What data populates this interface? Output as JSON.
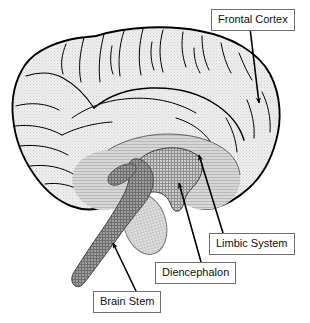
{
  "figure": {
    "width": 310,
    "height": 323,
    "background_color": "#ffffff"
  },
  "labels": [
    {
      "id": "frontal-cortex",
      "text": "Frontal Cortex",
      "box": {
        "x": 211,
        "y": 9,
        "w": 91,
        "h": 19
      },
      "leader": {
        "x1": 250,
        "y1": 28,
        "x2": 259,
        "y2": 106
      },
      "points_to": "frontal lobe cortex, right side of the brain"
    },
    {
      "id": "limbic-system",
      "text": "Limbic System",
      "box": {
        "x": 209,
        "y": 233,
        "w": 90,
        "h": 19
      },
      "leader": {
        "x1": 223,
        "y1": 233,
        "x2": 198,
        "y2": 152
      },
      "points_to": "limbic system, medium-gray band around the diencephalon"
    },
    {
      "id": "diencephalon",
      "text": "Diencephalon",
      "box": {
        "x": 155,
        "y": 262,
        "w": 85,
        "h": 19
      },
      "leader": {
        "x1": 201,
        "y1": 262,
        "x2": 178,
        "y2": 180
      },
      "points_to": "diencephalon, cross-hatched central mass"
    },
    {
      "id": "brain-stem",
      "text": "Brain Stem",
      "box": {
        "x": 93,
        "y": 291,
        "w": 73,
        "h": 19
      },
      "leader": {
        "x1": 136,
        "y1": 291,
        "x2": 112,
        "y2": 240
      },
      "points_to": "brain stem, dark-gray descending column"
    }
  ],
  "regions": [
    {
      "id": "cortex",
      "name": "Cerebral cortex",
      "fill": "#e8e8e8",
      "texture": "fine-stipple"
    },
    {
      "id": "limbic",
      "name": "Limbic system",
      "fill": "#c4c4c4",
      "texture": "fine-stipple"
    },
    {
      "id": "diencephalon",
      "name": "Diencephalon",
      "fill": "#a8a8a8",
      "texture": "cross-hatch"
    },
    {
      "id": "brain-stem",
      "name": "Brain stem",
      "fill": "#8a8a8a",
      "texture": "cross-hatch"
    },
    {
      "id": "cerebellum",
      "name": "Cerebellum",
      "fill": "#dcdcdc",
      "texture": "cross-hatch"
    }
  ],
  "colors": {
    "outline": "#000000",
    "sulci": "#000000",
    "label_border": "#6f6f6f",
    "label_text": "#111111",
    "label_background": "#ffffff",
    "leader_line": "#000000"
  }
}
